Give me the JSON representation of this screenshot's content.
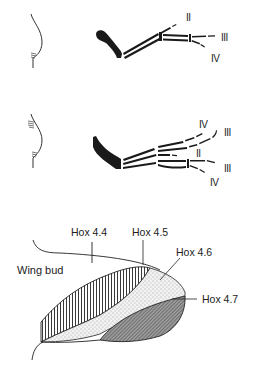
{
  "panel_top": {
    "digit_labels": [
      "II",
      "III",
      "IV"
    ]
  },
  "panel_middle": {
    "digit_labels": [
      "IV",
      "III",
      "II",
      "III",
      "IV"
    ]
  },
  "panel_bottom": {
    "region_label": "Wing bud",
    "hox_labels": [
      "Hox 4.4",
      "Hox 4.5",
      "Hox 4.6",
      "Hox 4.7"
    ]
  },
  "colors": {
    "ink": "#1a1a1a",
    "background": "#ffffff"
  }
}
